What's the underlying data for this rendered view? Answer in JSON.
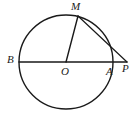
{
  "figure": {
    "kind": "circle-geometry-diagram",
    "background_color": "#ffffff",
    "stroke_color": "#1a1a1a",
    "label_color": "#1a1a1a",
    "circle": {
      "center_label": "O",
      "center_x": 66,
      "center_y": 62,
      "radius": 47,
      "stroke_width": 1.4
    },
    "points": {
      "B": {
        "label": "B",
        "x": 19,
        "y": 62,
        "label_x": 7,
        "label_y": 54
      },
      "O": {
        "label": "O",
        "x": 66,
        "y": 62,
        "label_x": 61,
        "label_y": 66
      },
      "A": {
        "label": "A",
        "x": 113,
        "y": 62,
        "label_x": 106,
        "label_y": 66
      },
      "P": {
        "label": "P",
        "x": 127,
        "y": 62,
        "label_x": 122,
        "label_y": 63
      },
      "M": {
        "label": "M",
        "x": 78,
        "y": 16,
        "label_x": 71,
        "label_y": 1
      }
    },
    "segments": [
      {
        "name": "diameter-BA-extended-to-P",
        "x1": 19,
        "y1": 62,
        "x2": 127,
        "y2": 62,
        "stroke_width": 1.4
      },
      {
        "name": "radius-OM",
        "x1": 66,
        "y1": 62,
        "x2": 78,
        "y2": 16,
        "stroke_width": 1.4
      },
      {
        "name": "tangent-MP",
        "x1": 78,
        "y1": 16,
        "x2": 127,
        "y2": 62,
        "stroke_width": 1.2
      }
    ]
  }
}
